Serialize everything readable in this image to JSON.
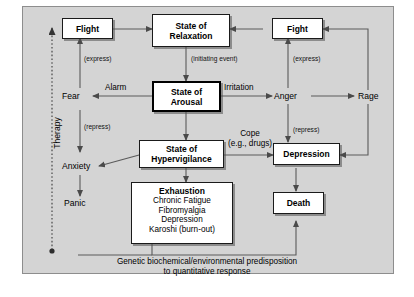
{
  "diagram": {
    "background_color": "#d4d4d4",
    "frame_border_color": "#8d8d8d",
    "node_fill": "#ffffff",
    "line_color": "#5a5a5a",
    "text_color": "#000000"
  },
  "nodes": {
    "flight": {
      "label": "Flight"
    },
    "fight": {
      "label": "Fight"
    },
    "relaxation": {
      "line1": "State of",
      "line2": "Relaxation"
    },
    "arousal": {
      "line1": "State of",
      "line2": "Arousal"
    },
    "hypervigilance": {
      "line1": "State of",
      "line2": "Hypervigilance"
    },
    "exhaustion": {
      "header": "Exhaustion",
      "items": [
        "Chronic Fatigue",
        "Fibromyalgia",
        "Depression",
        "Karoshi (burn-out)"
      ]
    },
    "depression": {
      "label": "Depression"
    },
    "death": {
      "label": "Death"
    }
  },
  "plain_nodes": {
    "fear": "Fear",
    "anger": "Anger",
    "rage": "Rage",
    "anxiety": "Anxiety",
    "panic": "Panic"
  },
  "edge_labels": {
    "alarm": "Alarm",
    "irritation": "Irritation",
    "initiating_event": "(initiating event)",
    "express_left": "(express)",
    "express_right": "(express)",
    "repress_left": "(repress)",
    "repress_right": "(repress)",
    "cope_line1": "Cope",
    "cope_line2": "(e.g., drugs)"
  },
  "axis": {
    "therapy": "Therapy"
  },
  "caption": {
    "line1": "Genetic biochemical/environmental predisposition",
    "line2": "to quantitative response"
  }
}
